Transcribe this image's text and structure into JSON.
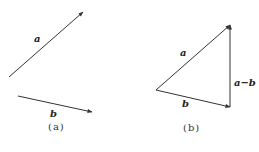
{
  "panels": [
    {
      "id": "a",
      "caption": "(a)",
      "vectors": [
        {
          "label": "a",
          "from": [
            9,
            77
          ],
          "to": [
            83,
            12
          ]
        },
        {
          "label": "b",
          "from": [
            18,
            96
          ],
          "to": [
            92,
            112
          ]
        }
      ]
    },
    {
      "id": "b",
      "caption": "(b)",
      "vectors": [
        {
          "label": "a",
          "from": [
            156,
            90
          ],
          "to": [
            230,
            25
          ]
        },
        {
          "label": "b",
          "from": [
            156,
            90
          ],
          "to": [
            230,
            107
          ]
        },
        {
          "label": "a−b",
          "from": [
            230,
            107
          ],
          "to": [
            230,
            25
          ]
        }
      ]
    }
  ],
  "colors": {
    "line": "#333333",
    "text": "#222222"
  }
}
